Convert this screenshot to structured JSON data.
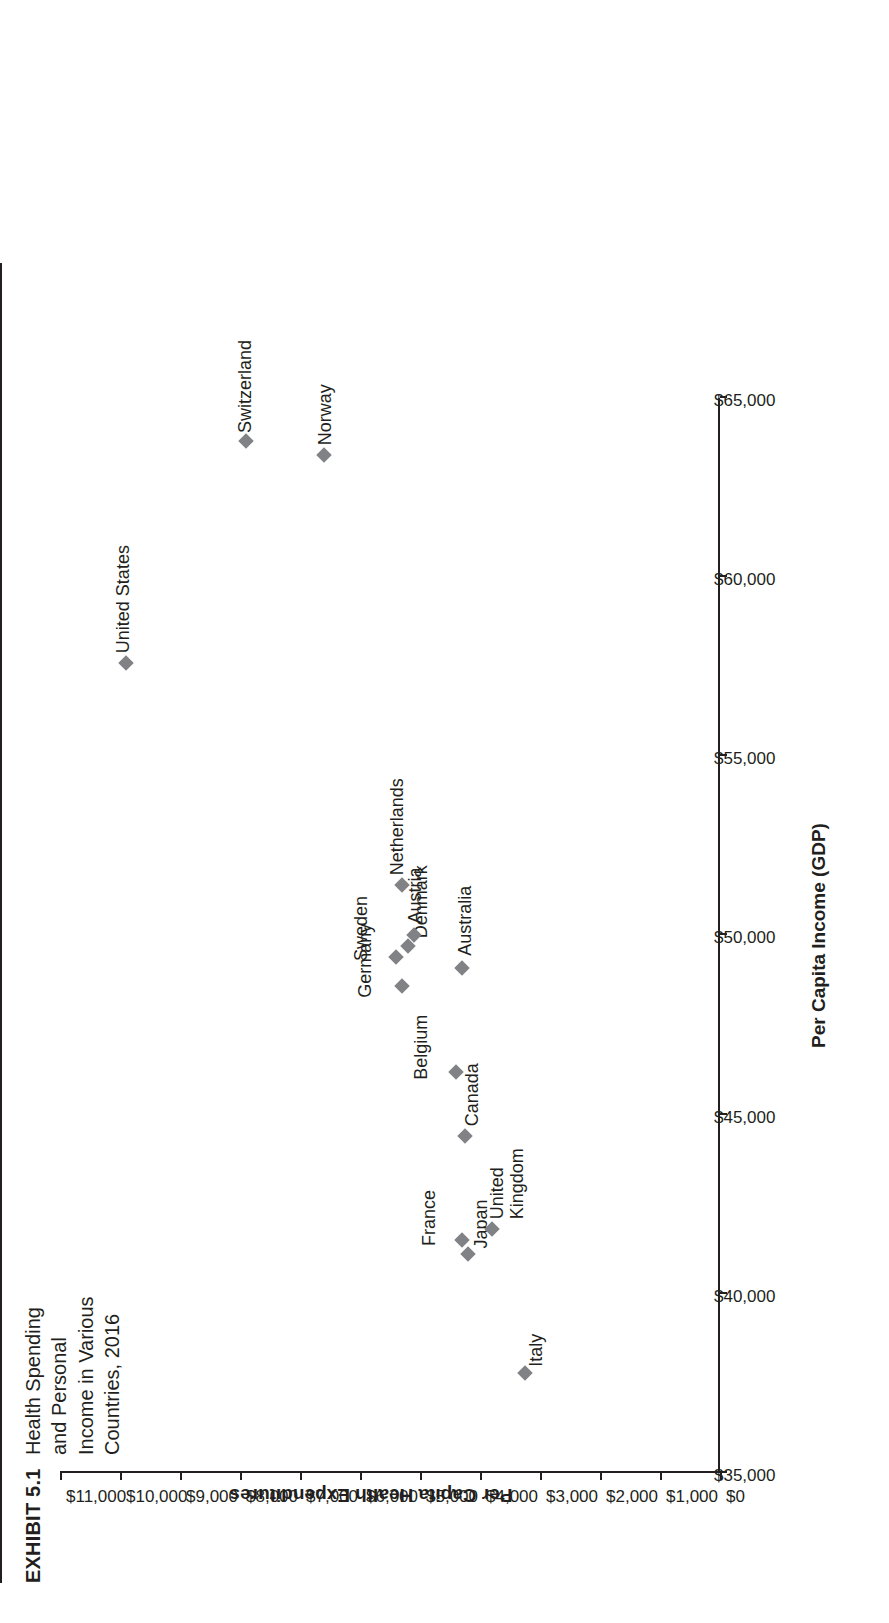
{
  "exhibit": {
    "number": "EXHIBIT 5.1",
    "title": "Health Spending and Personal Income in Various Countries, 2016"
  },
  "chart_data": {
    "type": "scatter",
    "title": "Health Spending and Personal Income in Various Countries, 2016",
    "xlabel": "Per Capita Income (GDP)",
    "ylabel": "Per Capita Health Expenditures",
    "xlim": [
      35000,
      65000
    ],
    "ylim": [
      0,
      11000
    ],
    "xticks": [
      "$35,000",
      "$40,000",
      "$45,000",
      "$50,000",
      "$55,000",
      "$60,000",
      "$65,000"
    ],
    "xtick_values": [
      35000,
      40000,
      45000,
      50000,
      55000,
      60000,
      65000
    ],
    "yticks": [
      "$0",
      "$1,000",
      "$2,000",
      "$3,000",
      "$4,000",
      "$5,000",
      "$6,000",
      "$7,000",
      "$8,000",
      "$9,000",
      "$10,000",
      "$11,000"
    ],
    "ytick_values": [
      0,
      1000,
      2000,
      3000,
      4000,
      5000,
      6000,
      7000,
      8000,
      9000,
      10000,
      11000
    ],
    "grid": false,
    "legend": "none",
    "marker_color": "#808285",
    "marker_shape": "diamond",
    "points": [
      {
        "label": "Italy",
        "x": 37800,
        "y": 3250,
        "lx": 6,
        "ly": 10
      },
      {
        "label": "Japan",
        "x": 41100,
        "y": 4200,
        "lx": 6,
        "ly": 12
      },
      {
        "label": "France",
        "x": 41500,
        "y": 4300,
        "lx": -6,
        "ly": -34
      },
      {
        "label": "United\nKingdom",
        "x": 41800,
        "y": 3800,
        "lx": 10,
        "ly": 4
      },
      {
        "label": "Canada",
        "x": 44400,
        "y": 4250,
        "lx": 10,
        "ly": 6
      },
      {
        "label": "Belgium",
        "x": 46200,
        "y": 4400,
        "lx": -8,
        "ly": -36
      },
      {
        "label": "Germany",
        "x": 48600,
        "y": 5300,
        "lx": -12,
        "ly": -38
      },
      {
        "label": "Australia",
        "x": 49100,
        "y": 4300,
        "lx": 12,
        "ly": 2
      },
      {
        "label": "Sweden",
        "x": 49400,
        "y": 5400,
        "lx": -4,
        "ly": -36
      },
      {
        "label": "Denmark",
        "x": 49700,
        "y": 5200,
        "lx": 0,
        "ly": 12
      },
      {
        "label": "Austria",
        "x": 50000,
        "y": 5100,
        "lx": 12,
        "ly": 0
      },
      {
        "label": "Netherlands",
        "x": 51400,
        "y": 5300,
        "lx": 10,
        "ly": -6
      },
      {
        "label": "United States",
        "x": 57600,
        "y": 9900,
        "lx": 10,
        "ly": -4
      },
      {
        "label": "Norway",
        "x": 63400,
        "y": 6600,
        "lx": 10,
        "ly": 0
      },
      {
        "label": "Switzerland",
        "x": 63800,
        "y": 7900,
        "lx": 8,
        "ly": -2
      }
    ]
  }
}
